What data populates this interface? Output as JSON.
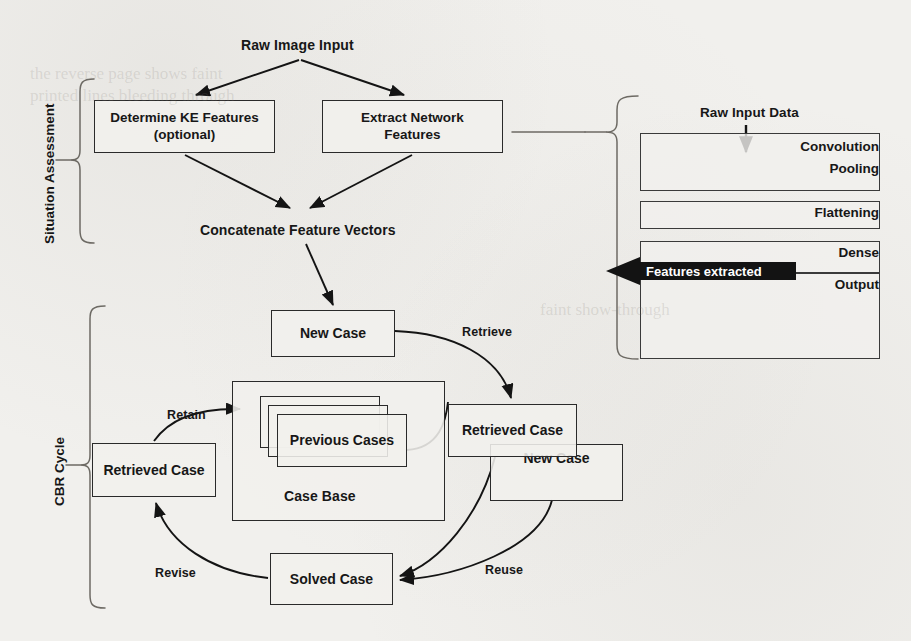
{
  "figure": {
    "ink_color": "#1a1a1a",
    "paper_color": "#f1f0ed",
    "arrow_fill": "#111111"
  },
  "sections": [
    {
      "id": "situation-assessment",
      "label": "Situation Assessment"
    },
    {
      "id": "cbr-cycle",
      "label": "CBR Cycle"
    }
  ],
  "situation_assessment": {
    "input_label": "Raw Image Input",
    "boxes": [
      {
        "id": "determine-ke-features",
        "line1": "Determine KE Features",
        "line2": "(optional)"
      },
      {
        "id": "extract-network-features",
        "line1": "Extract Network",
        "line2": "Features"
      }
    ],
    "concatenate_label": "Concatenate Feature Vectors"
  },
  "cbr_cycle": {
    "boxes": [
      {
        "id": "new-case-top",
        "label": "New Case"
      },
      {
        "id": "case-base",
        "label": "Case Base"
      },
      {
        "id": "previous-cases",
        "label": "Previous Cases"
      },
      {
        "id": "retrieved-case-left",
        "label": "Retrieved Case"
      },
      {
        "id": "retrieved-case-right",
        "label": "Retrieved Case"
      },
      {
        "id": "new-case-right",
        "label": "New Case"
      },
      {
        "id": "solved-case",
        "label": "Solved Case"
      }
    ],
    "edges": [
      {
        "id": "retrieve",
        "label": "Retrieve"
      },
      {
        "id": "reuse",
        "label": "Reuse"
      },
      {
        "id": "revise",
        "label": "Revise"
      },
      {
        "id": "retain",
        "label": "Retain"
      }
    ]
  },
  "cnn_panel": {
    "input_label": "Raw Input Data",
    "layers": [
      {
        "id": "convolution",
        "label": "Convolution"
      },
      {
        "id": "pooling",
        "label": "Pooling"
      },
      {
        "id": "flattening",
        "label": "Flattening"
      },
      {
        "id": "dense",
        "label": "Dense"
      },
      {
        "id": "output",
        "label": "Output"
      }
    ],
    "features_arrow_label": "Features extracted"
  }
}
